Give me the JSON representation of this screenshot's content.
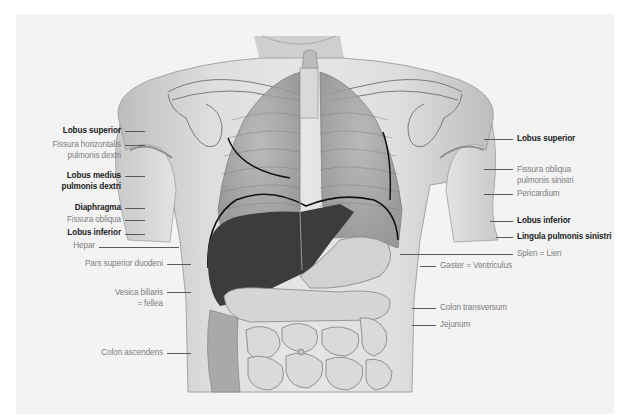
{
  "figure": {
    "colors": {
      "background": "#f3f3f3",
      "skin": "#d8d8d8",
      "liver": "#3a3a3a",
      "line": "#1a1a1a",
      "label_bold": "#1a1a1a",
      "label_light": "#7d7d7d"
    }
  },
  "labels_left": [
    {
      "id": "lobus-superior-dexter",
      "lines": [
        "Lobus superior"
      ],
      "weight": "bold"
    },
    {
      "id": "fissura-horizontalis",
      "lines": [
        "Fissura horizontalis",
        "pulmonis dextri"
      ],
      "weight": "light"
    },
    {
      "id": "lobus-medius",
      "lines": [
        "Lobus medius",
        "pulmonis dextri"
      ],
      "weight": "bold"
    },
    {
      "id": "diaphragma",
      "lines": [
        "Diaphragma"
      ],
      "weight": "bold"
    },
    {
      "id": "fissura-obliqua-dextra",
      "lines": [
        "Fissura obliqua"
      ],
      "weight": "light"
    },
    {
      "id": "lobus-inferior-dexter",
      "lines": [
        "Lobus inferior"
      ],
      "weight": "bold"
    },
    {
      "id": "hepar",
      "lines": [
        "Hepar"
      ],
      "weight": "light"
    },
    {
      "id": "pars-superior-duodeni",
      "lines": [
        "Pars superior duodeni"
      ],
      "weight": "light"
    },
    {
      "id": "vesica-biliaris",
      "lines": [
        "Vesica biliaris",
        "= fellea"
      ],
      "weight": "light"
    },
    {
      "id": "colon-ascendens",
      "lines": [
        "Colon ascendens"
      ],
      "weight": "light"
    }
  ],
  "labels_right": [
    {
      "id": "lobus-superior-sinister",
      "lines": [
        "Lobus superior"
      ],
      "weight": "bold"
    },
    {
      "id": "fissura-obliqua-sinistra",
      "lines": [
        "Fissura obliqua",
        "pulmonis sinistri"
      ],
      "weight": "light"
    },
    {
      "id": "pericardium",
      "lines": [
        "Pericardium"
      ],
      "weight": "light"
    },
    {
      "id": "lobus-inferior-sinister",
      "lines": [
        "Lobus inferior"
      ],
      "weight": "bold"
    },
    {
      "id": "lingula",
      "lines": [
        "Lingula pulmonis sinistri"
      ],
      "weight": "bold"
    },
    {
      "id": "splen",
      "lines": [
        "Splen = Lien"
      ],
      "weight": "light"
    },
    {
      "id": "gaster",
      "lines": [
        "Gaster = Ventriculus"
      ],
      "weight": "light"
    },
    {
      "id": "colon-transversum",
      "lines": [
        "Colon transversum"
      ],
      "weight": "light"
    },
    {
      "id": "jejunum",
      "lines": [
        "Jejunum"
      ],
      "weight": "light"
    }
  ]
}
